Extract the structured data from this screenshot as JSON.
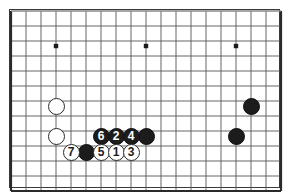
{
  "figure": {
    "kind": "go-board-diagram",
    "title": "",
    "background_color": "#ffffff",
    "border_color": "#3a3a3a",
    "line_color": "#555555",
    "black_stone_color": "#1c1c1c",
    "white_stone_color": "#ffffff",
    "stone_outline_color": "#2a2a2a"
  },
  "board": {
    "origin_x": 11,
    "origin_y": 11,
    "cell_size": 15,
    "cols": 18,
    "rows": 12,
    "stone_radius": 8.5,
    "star_point_radius": 2.2,
    "star_points": [
      {
        "name": "star-point-left",
        "cx": 56,
        "cy": 46
      },
      {
        "name": "star-point-center",
        "cx": 146,
        "cy": 46
      },
      {
        "name": "star-point-right",
        "cx": 236,
        "cy": 46
      }
    ]
  },
  "stones": [
    {
      "id": "white-upper-left",
      "color": "white",
      "label": "",
      "cx": 56,
      "cy": 106
    },
    {
      "id": "white-lower-left",
      "color": "white",
      "label": "",
      "cx": 56,
      "cy": 136
    },
    {
      "id": "black-right-upper",
      "color": "black",
      "label": "",
      "cx": 251,
      "cy": 106
    },
    {
      "id": "black-right-lower",
      "color": "black",
      "label": "",
      "cx": 236,
      "cy": 136
    },
    {
      "id": "black-move-6",
      "color": "black",
      "label": "6",
      "cx": 101,
      "cy": 136
    },
    {
      "id": "black-move-2",
      "color": "black",
      "label": "2",
      "cx": 116,
      "cy": 136
    },
    {
      "id": "black-move-4",
      "color": "black",
      "label": "4",
      "cx": 131,
      "cy": 136
    },
    {
      "id": "black-unnumbered-row",
      "color": "black",
      "label": "",
      "cx": 146,
      "cy": 136
    },
    {
      "id": "white-move-7",
      "color": "white",
      "label": "7",
      "cx": 71,
      "cy": 152
    },
    {
      "id": "black-unnumbered-bottom",
      "color": "black",
      "label": "",
      "cx": 86,
      "cy": 152
    },
    {
      "id": "white-move-5",
      "color": "white",
      "label": "5",
      "cx": 101,
      "cy": 152
    },
    {
      "id": "white-move-1",
      "color": "white",
      "label": "1",
      "cx": 116,
      "cy": 152
    },
    {
      "id": "white-move-3",
      "color": "white",
      "label": "3",
      "cx": 131,
      "cy": 152
    }
  ]
}
